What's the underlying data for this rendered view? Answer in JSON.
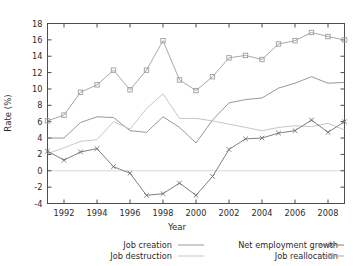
{
  "chart_data": {
    "type": "line",
    "title": "",
    "xlabel": "Year",
    "ylabel": "Rate (%)",
    "xlim": [
      1991,
      2009
    ],
    "ylim": [
      -4,
      18
    ],
    "xticks": [
      1992,
      1994,
      1996,
      1998,
      2000,
      2002,
      2004,
      2006,
      2008
    ],
    "xtick_labels": [
      "1992",
      "1994",
      "1996",
      "1998",
      "2000",
      "2002",
      "2004",
      "2006",
      "2008"
    ],
    "yticks": [
      -4,
      -2,
      0,
      2,
      4,
      6,
      8,
      10,
      12,
      14,
      16,
      18
    ],
    "ytick_labels": [
      "-4",
      "-2",
      "0",
      "2",
      "4",
      "6",
      "8",
      "10",
      "12",
      "14",
      "16",
      "18"
    ],
    "grid": false,
    "zero_line": true,
    "legend_position": "bottom",
    "x": [
      1991,
      1992,
      1993,
      1994,
      1995,
      1996,
      1997,
      1998,
      1999,
      2000,
      2001,
      2002,
      2003,
      2004,
      2005,
      2006,
      2007,
      2008,
      2009
    ],
    "series": [
      {
        "name": "Job creation",
        "marker": "none",
        "color": "#8c8c8c",
        "values": [
          4.0,
          4.0,
          5.9,
          6.6,
          6.5,
          4.9,
          4.7,
          6.6,
          5.3,
          3.4,
          6.2,
          8.3,
          8.7,
          8.9,
          10.1,
          10.7,
          11.5,
          10.7,
          10.8
        ]
      },
      {
        "name": "Job destruction",
        "marker": "none",
        "color": "#bfbfbf",
        "values": [
          2.1,
          2.8,
          3.6,
          3.8,
          6.0,
          5.1,
          7.6,
          9.4,
          6.4,
          6.4,
          6.1,
          5.7,
          5.3,
          4.9,
          5.3,
          5.5,
          5.4,
          5.8,
          5.0
        ]
      },
      {
        "name": "Net employment growth",
        "marker": "x",
        "color": "#707070",
        "values": [
          2.4,
          1.3,
          2.3,
          2.7,
          0.5,
          -0.3,
          -3.0,
          -2.8,
          -1.5,
          -3.0,
          -0.7,
          2.6,
          3.9,
          4.0,
          4.6,
          4.9,
          6.2,
          4.7,
          6.0
        ]
      },
      {
        "name": "Job reallocation",
        "marker": "square",
        "color": "#9e9e9e",
        "values": [
          6.1,
          6.8,
          9.6,
          10.5,
          12.3,
          9.9,
          12.3,
          15.9,
          11.1,
          9.8,
          11.5,
          13.8,
          14.1,
          13.6,
          15.5,
          15.9,
          16.9,
          16.4,
          16.0
        ]
      }
    ]
  },
  "legend": {
    "entries": [
      {
        "label": "Job creation",
        "marker": "line",
        "series_index": 0
      },
      {
        "label": "Job destruction",
        "marker": "line",
        "series_index": 1
      },
      {
        "label": "Net employment growth",
        "marker": "x",
        "series_index": 2
      },
      {
        "label": "Job reallocation",
        "marker": "square",
        "series_index": 3
      }
    ]
  },
  "colors": {
    "axis": "#4d4d4d",
    "zero_line": "#d8d8d8",
    "background": "#ffffff",
    "text": "#2b2b2b"
  }
}
